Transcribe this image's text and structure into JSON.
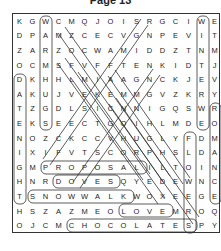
{
  "title": "Page 13",
  "grid": [
    [
      "K",
      "G",
      "W",
      "C",
      "M",
      "Q",
      "J",
      "O",
      "I",
      "S",
      "R",
      "G",
      "C",
      "I",
      "W",
      "E"
    ],
    [
      "D",
      "P",
      "A",
      "M",
      "Z",
      "C",
      "E",
      "C",
      "V",
      "G",
      "N",
      "P",
      "E",
      "V",
      "I",
      "T"
    ],
    [
      "Z",
      "A",
      "R",
      "Z",
      "O",
      "C",
      "W",
      "A",
      "M",
      "I",
      "D",
      "D",
      "Z",
      "T",
      "N",
      "M"
    ],
    [
      "O",
      "C",
      "M",
      "S",
      "F",
      "V",
      "F",
      "F",
      "T",
      "E",
      "N",
      "K",
      "I",
      "D",
      "T",
      "J"
    ],
    [
      "D",
      "K",
      "H",
      "H",
      "L",
      "M",
      "I",
      "A",
      "A",
      "G",
      "N",
      "C",
      "K",
      "J",
      "E",
      "V"
    ],
    [
      "A",
      "K",
      "U",
      "J",
      "V",
      "E",
      "K",
      "E",
      "M",
      "M",
      "G",
      "V",
      "Z",
      "K",
      "R",
      "Y"
    ],
    [
      "T",
      "Z",
      "G",
      "D",
      "L",
      "S",
      "I",
      "C",
      "N",
      "N",
      "I",
      "G",
      "Q",
      "S",
      "W",
      "R"
    ],
    [
      "E",
      "K",
      "S",
      "E",
      "E",
      "C",
      "T",
      "G",
      "O",
      "I",
      "H",
      "L",
      "M",
      "D",
      "E",
      "O"
    ],
    [
      "N",
      "O",
      "Z",
      "C",
      "K",
      "C",
      "C",
      "V",
      "H",
      "U",
      "G",
      "L",
      "Y",
      "F",
      "D",
      "M"
    ],
    [
      "I",
      "X",
      "I",
      "F",
      "V",
      "T",
      "S",
      "C",
      "O",
      "R",
      "P",
      "H",
      "S",
      "L",
      "D",
      "A"
    ],
    [
      "G",
      "M",
      "P",
      "R",
      "O",
      "P",
      "O",
      "S",
      "A",
      "L",
      "I",
      "L",
      "T",
      "O",
      "I",
      "N"
    ],
    [
      "H",
      "N",
      "R",
      "D",
      "O",
      "V",
      "E",
      "S",
      "Q",
      "Y",
      "E",
      "D",
      "E",
      "W",
      "N",
      "C"
    ],
    [
      "T",
      "S",
      "N",
      "O",
      "W",
      "W",
      "A",
      "L",
      "K",
      "W",
      "O",
      "X",
      "E",
      "E",
      "G",
      "E"
    ],
    [
      "H",
      "S",
      "Z",
      "A",
      "Z",
      "M",
      "E",
      "O",
      "L",
      "O",
      "V",
      "E",
      "M",
      "R",
      "O",
      "Q"
    ],
    [
      "O",
      "J",
      "C",
      "M",
      "C",
      "H",
      "O",
      "C",
      "O",
      "L",
      "A",
      "T",
      "E",
      "S",
      "P",
      "Y"
    ]
  ],
  "found_words": [
    "WARMHUGS",
    "WINTER",
    "ROMANCE",
    "DATING",
    "PROPOSAL",
    "DOVES",
    "SNOWWALK",
    "LOVE",
    "CHOCOLATES",
    "FLOWERS",
    "WEDDING"
  ]
}
